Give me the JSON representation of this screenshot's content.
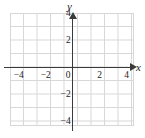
{
  "figure": {
    "type": "coordinate-grid",
    "background_color": "#ffffff",
    "grid_color": "#d7d7d7",
    "axis_color": "#3a3a3a",
    "text_color": "#1c1c1c"
  },
  "axes": {
    "x_label": "x",
    "y_label": "y",
    "origin_label": "0",
    "x_arrow": "arrow-right",
    "y_arrow": "arrow-up"
  },
  "chart_data": {
    "type": "scatter",
    "title": "",
    "xlabel": "x",
    "ylabel": "y",
    "xlim": [
      -5,
      5
    ],
    "ylim": [
      -4.5,
      4.5
    ],
    "grid": true,
    "legend": null,
    "x_ticks": [
      -4,
      -2,
      0,
      2,
      4
    ],
    "y_ticks": [
      4,
      2,
      -2,
      -4
    ],
    "x_tick_labels": [
      "-4",
      "-2",
      "0",
      "2",
      "4"
    ],
    "y_tick_labels": [
      "4",
      "2",
      "-2",
      "-4"
    ],
    "series": [],
    "values": [],
    "annotations": []
  },
  "ticks": {
    "x": [
      {
        "label": "−4",
        "value": -4
      },
      {
        "label": "−2",
        "value": -2
      },
      {
        "label": "0",
        "value": 0
      },
      {
        "label": "2",
        "value": 2
      },
      {
        "label": "4",
        "value": 4
      }
    ],
    "y": [
      {
        "label": "4",
        "value": 4
      },
      {
        "label": "2",
        "value": 2
      },
      {
        "label": "−2",
        "value": -2
      },
      {
        "label": "−4",
        "value": -4
      }
    ]
  }
}
